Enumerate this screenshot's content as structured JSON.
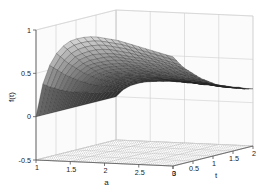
{
  "figure": {
    "background_color": "#ffffff",
    "width": 267,
    "height": 193,
    "type": "matlab-3d-surface"
  },
  "chart_data": {
    "type": "surface",
    "title": "",
    "subtitle": "",
    "xlabel": "a",
    "ylabel": "t",
    "zlabel": "f(t)",
    "xlim": [
      1,
      3
    ],
    "ylim": [
      0,
      2
    ],
    "zlim": [
      -0.5,
      1
    ],
    "xticks": [
      1,
      1.5,
      2,
      2.5,
      3
    ],
    "yticks": [
      0,
      0.5,
      1,
      1.5,
      2
    ],
    "zticks": [
      -0.5,
      0,
      0.5,
      1
    ],
    "xticklabels": [
      "1",
      "1.5",
      "2",
      "2.5",
      "3"
    ],
    "yticklabels": [
      "0",
      "0.5",
      "1",
      "1.5",
      "2"
    ],
    "zticklabels": [
      "-0.5",
      "0",
      "0.5",
      "1"
    ],
    "grid": true,
    "legend": false,
    "colormap": "gray",
    "mesh_visible": true,
    "mesh_line_color": "#1f1f1f",
    "surface_shading": "faceted",
    "view_azimuth": -37.5,
    "view_elevation": 30,
    "nx": 21,
    "ny": 21,
    "z_min_observed": 0.0,
    "z_max_observed": 0.95,
    "x": [
      1.0,
      1.1,
      1.2,
      1.3,
      1.4,
      1.5,
      1.6,
      1.7,
      1.8,
      1.9,
      2.0,
      2.1,
      2.2,
      2.3,
      2.4,
      2.5,
      2.6,
      2.7,
      2.8,
      2.9,
      3.0
    ],
    "y": [
      0.0,
      0.1,
      0.2,
      0.3,
      0.4,
      0.5,
      0.6,
      0.7,
      0.8,
      0.9,
      1.0,
      1.1,
      1.2,
      1.3,
      1.4,
      1.5,
      1.6,
      1.7,
      1.8,
      1.9,
      2.0
    ],
    "z_rows_note": "z[j][i] where j indexes y (t) and i indexes x (a)",
    "z": [
      [
        0.0,
        0.38,
        0.6,
        0.74,
        0.83,
        0.89,
        0.92,
        0.94,
        0.95,
        0.95,
        0.94,
        0.93,
        0.92,
        0.9,
        0.88,
        0.86,
        0.84,
        0.82,
        0.8,
        0.78,
        0.76
      ],
      [
        0.0,
        0.35,
        0.56,
        0.69,
        0.78,
        0.83,
        0.86,
        0.88,
        0.89,
        0.89,
        0.88,
        0.87,
        0.86,
        0.84,
        0.82,
        0.8,
        0.78,
        0.76,
        0.74,
        0.72,
        0.7
      ],
      [
        0.0,
        0.32,
        0.52,
        0.64,
        0.72,
        0.77,
        0.8,
        0.82,
        0.83,
        0.83,
        0.82,
        0.81,
        0.8,
        0.78,
        0.76,
        0.74,
        0.72,
        0.7,
        0.68,
        0.66,
        0.64
      ],
      [
        0.0,
        0.3,
        0.48,
        0.59,
        0.67,
        0.71,
        0.74,
        0.76,
        0.77,
        0.77,
        0.76,
        0.75,
        0.74,
        0.72,
        0.71,
        0.69,
        0.67,
        0.65,
        0.63,
        0.61,
        0.59
      ],
      [
        0.0,
        0.27,
        0.44,
        0.55,
        0.62,
        0.66,
        0.69,
        0.7,
        0.71,
        0.71,
        0.7,
        0.69,
        0.68,
        0.67,
        0.65,
        0.64,
        0.62,
        0.6,
        0.58,
        0.57,
        0.55
      ],
      [
        0.0,
        0.25,
        0.41,
        0.51,
        0.57,
        0.61,
        0.63,
        0.65,
        0.66,
        0.66,
        0.65,
        0.64,
        0.63,
        0.62,
        0.6,
        0.59,
        0.57,
        0.56,
        0.54,
        0.52,
        0.51
      ],
      [
        0.0,
        0.23,
        0.38,
        0.47,
        0.53,
        0.56,
        0.58,
        0.6,
        0.61,
        0.61,
        0.6,
        0.59,
        0.58,
        0.57,
        0.56,
        0.54,
        0.53,
        0.51,
        0.5,
        0.48,
        0.47
      ],
      [
        0.0,
        0.21,
        0.35,
        0.43,
        0.49,
        0.52,
        0.54,
        0.55,
        0.56,
        0.56,
        0.55,
        0.54,
        0.54,
        0.52,
        0.51,
        0.5,
        0.49,
        0.47,
        0.46,
        0.45,
        0.43
      ],
      [
        0.0,
        0.2,
        0.32,
        0.4,
        0.45,
        0.48,
        0.5,
        0.51,
        0.52,
        0.52,
        0.51,
        0.5,
        0.49,
        0.48,
        0.47,
        0.46,
        0.45,
        0.44,
        0.42,
        0.41,
        0.4
      ],
      [
        0.0,
        0.18,
        0.3,
        0.37,
        0.41,
        0.44,
        0.46,
        0.47,
        0.48,
        0.48,
        0.47,
        0.46,
        0.45,
        0.45,
        0.44,
        0.42,
        0.41,
        0.4,
        0.39,
        0.38,
        0.37
      ],
      [
        0.0,
        0.17,
        0.27,
        0.34,
        0.38,
        0.41,
        0.42,
        0.43,
        0.44,
        0.44,
        0.44,
        0.43,
        0.42,
        0.41,
        0.4,
        0.39,
        0.38,
        0.37,
        0.36,
        0.35,
        0.34
      ],
      [
        0.0,
        0.16,
        0.25,
        0.31,
        0.35,
        0.38,
        0.39,
        0.4,
        0.41,
        0.41,
        0.4,
        0.4,
        0.39,
        0.38,
        0.37,
        0.36,
        0.35,
        0.34,
        0.33,
        0.32,
        0.31
      ],
      [
        0.0,
        0.14,
        0.23,
        0.29,
        0.33,
        0.35,
        0.36,
        0.37,
        0.38,
        0.38,
        0.37,
        0.37,
        0.36,
        0.35,
        0.34,
        0.33,
        0.33,
        0.32,
        0.31,
        0.3,
        0.29
      ],
      [
        0.0,
        0.13,
        0.22,
        0.27,
        0.3,
        0.32,
        0.34,
        0.34,
        0.35,
        0.35,
        0.34,
        0.34,
        0.33,
        0.32,
        0.32,
        0.31,
        0.3,
        0.29,
        0.28,
        0.28,
        0.27
      ],
      [
        0.0,
        0.12,
        0.2,
        0.25,
        0.28,
        0.3,
        0.31,
        0.32,
        0.32,
        0.32,
        0.32,
        0.31,
        0.31,
        0.3,
        0.29,
        0.28,
        0.28,
        0.27,
        0.26,
        0.25,
        0.25
      ],
      [
        0.0,
        0.11,
        0.19,
        0.23,
        0.26,
        0.28,
        0.29,
        0.29,
        0.3,
        0.3,
        0.29,
        0.29,
        0.28,
        0.28,
        0.27,
        0.26,
        0.26,
        0.25,
        0.24,
        0.23,
        0.23
      ],
      [
        0.0,
        0.11,
        0.17,
        0.21,
        0.24,
        0.26,
        0.27,
        0.27,
        0.28,
        0.28,
        0.27,
        0.27,
        0.26,
        0.26,
        0.25,
        0.24,
        0.24,
        0.23,
        0.22,
        0.22,
        0.21
      ],
      [
        0.0,
        0.1,
        0.16,
        0.2,
        0.22,
        0.24,
        0.25,
        0.25,
        0.26,
        0.26,
        0.25,
        0.25,
        0.24,
        0.24,
        0.23,
        0.23,
        0.22,
        0.21,
        0.21,
        0.2,
        0.2
      ],
      [
        0.0,
        0.09,
        0.15,
        0.18,
        0.21,
        0.22,
        0.23,
        0.23,
        0.24,
        0.24,
        0.23,
        0.23,
        0.23,
        0.22,
        0.21,
        0.21,
        0.2,
        0.2,
        0.19,
        0.19,
        0.18
      ],
      [
        0.0,
        0.09,
        0.14,
        0.17,
        0.19,
        0.21,
        0.21,
        0.22,
        0.22,
        0.22,
        0.22,
        0.21,
        0.21,
        0.2,
        0.2,
        0.19,
        0.19,
        0.18,
        0.18,
        0.17,
        0.17
      ],
      [
        0.0,
        0.08,
        0.13,
        0.16,
        0.18,
        0.19,
        0.2,
        0.2,
        0.21,
        0.21,
        0.2,
        0.2,
        0.2,
        0.19,
        0.19,
        0.18,
        0.18,
        0.17,
        0.17,
        0.16,
        0.16
      ]
    ]
  },
  "axes": {
    "z_axis_label": "f(t)",
    "x_axis_label": "a",
    "y_axis_label": "t"
  }
}
